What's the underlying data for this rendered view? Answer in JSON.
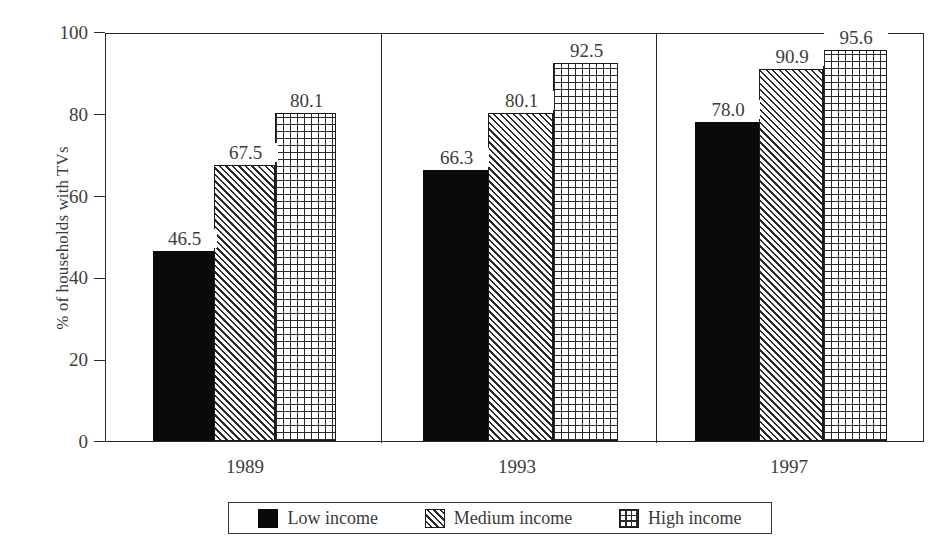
{
  "chart_data": {
    "type": "bar",
    "title": "",
    "subtitle": "",
    "xlabel": "",
    "ylabel": "% of households with TVs",
    "ylim": [
      0,
      100
    ],
    "yticks": [
      0,
      20,
      40,
      60,
      80,
      100
    ],
    "ytick_labels": [
      "0",
      "20",
      "40",
      "60",
      "80",
      "100"
    ],
    "grid": false,
    "legend_position": "bottom",
    "categories": [
      "1989",
      "1993",
      "1997"
    ],
    "series": [
      {
        "name": "Low income",
        "values": [
          46.5,
          66.3,
          78.0
        ],
        "value_labels": [
          "46.5",
          "66.3",
          "78.0"
        ],
        "pattern": "solid-black"
      },
      {
        "name": "Medium income",
        "values": [
          67.5,
          80.1,
          90.9
        ],
        "value_labels": [
          "67.5",
          "80.1",
          "90.9"
        ],
        "pattern": "diagonal-hatch"
      },
      {
        "name": "High income",
        "values": [
          80.1,
          92.5,
          95.6
        ],
        "value_labels": [
          "80.1",
          "92.5",
          "95.6"
        ],
        "pattern": "cross-hatch-grid"
      }
    ],
    "colors": {
      "low_income": "#0a0a0a",
      "medium_income": "#ffffff",
      "high_income": "#ffffff",
      "axis": "#2a2a2a",
      "text": "#3d3d3d",
      "background": "#ffffff"
    }
  },
  "legend": {
    "items": [
      {
        "label": "Low income",
        "swatch": "solid-black-swatch"
      },
      {
        "label": "Medium income",
        "swatch": "diagonal-hatch-swatch"
      },
      {
        "label": "High income",
        "swatch": "cross-hatch-swatch"
      }
    ]
  }
}
